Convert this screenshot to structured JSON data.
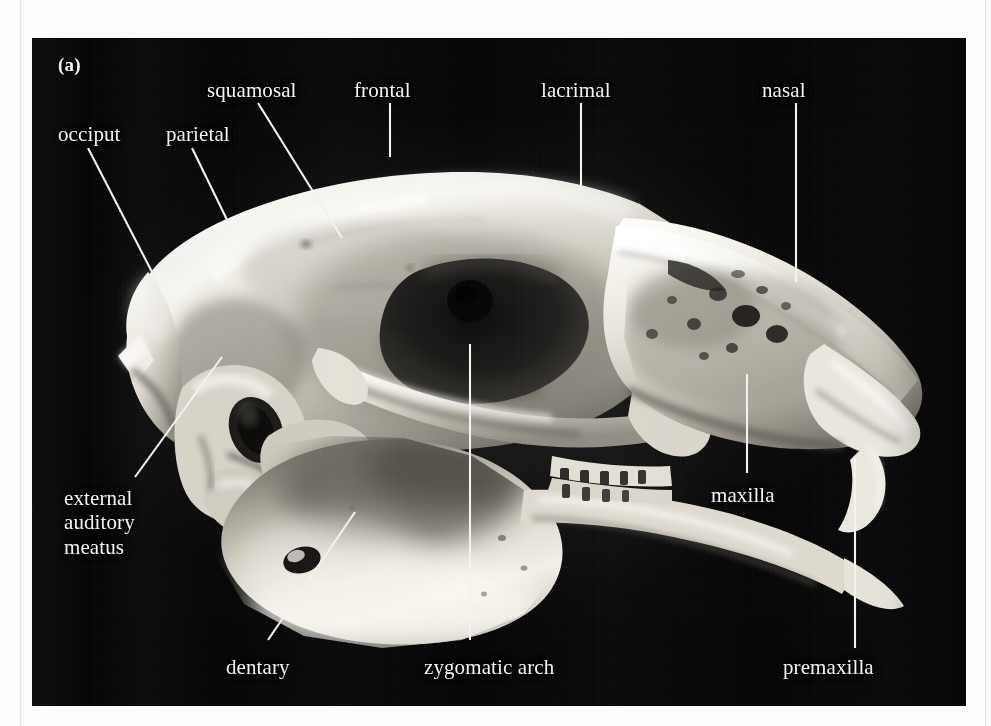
{
  "figure": {
    "panel_letter": "(a)",
    "photo_background_color": "#050505",
    "label_color": "#f4f4f0",
    "leader_line_color": "#f2f2ee",
    "page_background_color": "#fdfdfd"
  },
  "annotations": [
    {
      "id": "occiput",
      "label": "occiput",
      "align": "left",
      "text_x": 58,
      "text_y": 122,
      "leader": {
        "x1": 88,
        "y1": 148,
        "x2": 168,
        "y2": 303
      }
    },
    {
      "id": "parietal",
      "label": "parietal",
      "align": "left",
      "text_x": 166,
      "text_y": 122,
      "leader": {
        "x1": 192,
        "y1": 148,
        "x2": 231,
        "y2": 228
      }
    },
    {
      "id": "squamosal",
      "label": "squamosal",
      "align": "left",
      "text_x": 207,
      "text_y": 78,
      "leader": {
        "x1": 258,
        "y1": 103,
        "x2": 342,
        "y2": 238
      }
    },
    {
      "id": "frontal",
      "label": "frontal",
      "align": "left",
      "text_x": 354,
      "text_y": 78,
      "leader": {
        "x1": 390,
        "y1": 103,
        "x2": 390,
        "y2": 157
      }
    },
    {
      "id": "lacrimal",
      "label": "lacrimal",
      "align": "left",
      "text_x": 541,
      "text_y": 78,
      "leader": {
        "x1": 581,
        "y1": 103,
        "x2": 581,
        "y2": 190
      }
    },
    {
      "id": "nasal",
      "label": "nasal",
      "align": "left",
      "text_x": 762,
      "text_y": 78,
      "leader": {
        "x1": 796,
        "y1": 103,
        "x2": 796,
        "y2": 282
      }
    },
    {
      "id": "external-auditory-meatus",
      "label": "external\nauditory\nmeatus",
      "align": "left",
      "text_x": 64,
      "text_y": 486,
      "leader": {
        "x1": 135,
        "y1": 477,
        "x2": 222,
        "y2": 357
      }
    },
    {
      "id": "dentary",
      "label": "dentary",
      "align": "left",
      "text_x": 226,
      "text_y": 655,
      "leader": {
        "x1": 268,
        "y1": 640,
        "x2": 355,
        "y2": 512
      }
    },
    {
      "id": "zygomatic-arch",
      "label": "zygomatic arch",
      "align": "left",
      "text_x": 424,
      "text_y": 655,
      "leader": {
        "x1": 470,
        "y1": 640,
        "x2": 470,
        "y2": 344
      }
    },
    {
      "id": "maxilla",
      "label": "maxilla",
      "align": "left",
      "text_x": 711,
      "text_y": 483,
      "leader": {
        "x1": 747,
        "y1": 473,
        "x2": 747,
        "y2": 374
      }
    },
    {
      "id": "premaxilla",
      "label": "premaxilla",
      "align": "left",
      "text_x": 783,
      "text_y": 655,
      "leader": {
        "x1": 855,
        "y1": 648,
        "x2": 855,
        "y2": 456
      }
    }
  ]
}
